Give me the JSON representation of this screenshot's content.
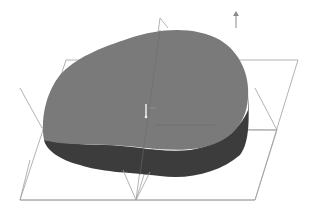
{
  "viewport": {
    "type": "3d-cad-model-view",
    "background": "#ffffff"
  },
  "model": {
    "shape": "extruded-rounded-cam-profile",
    "top_face_color": "#7a7a7a",
    "side_face_color": "#3c3c3c",
    "edge_color": "#555555"
  },
  "datum_planes": {
    "color": "#9a9a9a",
    "count": 3,
    "items": [
      {
        "name": "front-plane"
      },
      {
        "name": "top-plane"
      },
      {
        "name": "right-plane"
      }
    ]
  },
  "triad": {
    "icon": "up-arrow-icon",
    "color": "#8a8a8a"
  },
  "origin_marker": {
    "icon": "origin-icon",
    "color": "#e0e0e0"
  }
}
